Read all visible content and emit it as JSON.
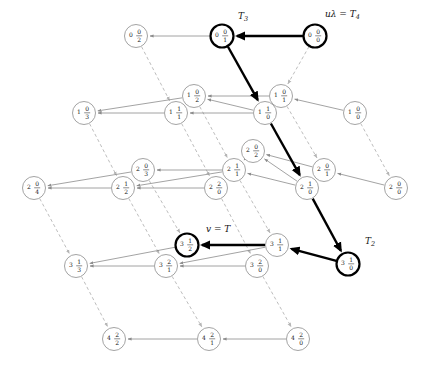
{
  "figure": {
    "type": "state-transition-diagram",
    "node_radius": 11.5,
    "colors": {
      "node_stroke": "#8c8c8c",
      "node_stroke_bold": "#000000",
      "edge_solid": "#8c8c8c",
      "edge_dashed": "#b5b5b5",
      "edge_bold": "#000000",
      "text": "#1a1a1a",
      "background": "#ffffff"
    }
  },
  "nodes": [
    {
      "id": "n002",
      "top": "0 0",
      "bottom": "2",
      "x": 136,
      "y": 36,
      "bold": false,
      "label": ""
    },
    {
      "id": "n001",
      "top": "0 0",
      "bottom": "1",
      "x": 222,
      "y": 36,
      "bold": true,
      "label": "T3"
    },
    {
      "id": "n000",
      "top": "0 0",
      "bottom": "0",
      "x": 315,
      "y": 36,
      "bold": true,
      "label": "u4"
    },
    {
      "id": "n103",
      "top": "1 0",
      "bottom": "3",
      "x": 84,
      "y": 113,
      "bold": false,
      "label": ""
    },
    {
      "id": "n111",
      "top": "1 1",
      "bottom": "1",
      "x": 176,
      "y": 113,
      "bold": false,
      "label": ""
    },
    {
      "id": "n102",
      "top": "1 0",
      "bottom": "2",
      "x": 194,
      "y": 96,
      "bold": false,
      "label": ""
    },
    {
      "id": "n110",
      "top": "1 1",
      "bottom": "0",
      "x": 265,
      "y": 113,
      "bold": false,
      "label": ""
    },
    {
      "id": "n101",
      "top": "1 0",
      "bottom": "1",
      "x": 281,
      "y": 96,
      "bold": false,
      "label": ""
    },
    {
      "id": "n100",
      "top": "1 0",
      "bottom": "0",
      "x": 355,
      "y": 113,
      "bold": false,
      "label": ""
    },
    {
      "id": "n204",
      "top": "2 0",
      "bottom": "4",
      "x": 34,
      "y": 188,
      "bold": false,
      "label": ""
    },
    {
      "id": "n212",
      "top": "2 1",
      "bottom": "2",
      "x": 123,
      "y": 188,
      "bold": false,
      "label": ""
    },
    {
      "id": "n203",
      "top": "2 0",
      "bottom": "3",
      "x": 143,
      "y": 170,
      "bold": false,
      "label": ""
    },
    {
      "id": "n220",
      "top": "2 2",
      "bottom": "0",
      "x": 216,
      "y": 188,
      "bold": false,
      "label": ""
    },
    {
      "id": "n211",
      "top": "2 1",
      "bottom": "1",
      "x": 234,
      "y": 170,
      "bold": false,
      "label": ""
    },
    {
      "id": "n202",
      "top": "2 0",
      "bottom": "2",
      "x": 253,
      "y": 151,
      "bold": false,
      "label": ""
    },
    {
      "id": "n210",
      "top": "2 1",
      "bottom": "0",
      "x": 307,
      "y": 188,
      "bold": false,
      "label": ""
    },
    {
      "id": "n201",
      "top": "2 0",
      "bottom": "1",
      "x": 324,
      "y": 170,
      "bold": false,
      "label": ""
    },
    {
      "id": "n200",
      "top": "2 0",
      "bottom": "0",
      "x": 396,
      "y": 188,
      "bold": false,
      "label": ""
    },
    {
      "id": "n313",
      "top": "3 1",
      "bottom": "3",
      "x": 76,
      "y": 266,
      "bold": false,
      "label": ""
    },
    {
      "id": "n321",
      "top": "3 2",
      "bottom": "1",
      "x": 166,
      "y": 266,
      "bold": false,
      "label": ""
    },
    {
      "id": "n312",
      "top": "3 1",
      "bottom": "2",
      "x": 187,
      "y": 245,
      "bold": true,
      "label": "v"
    },
    {
      "id": "n320",
      "top": "3 2",
      "bottom": "0",
      "x": 257,
      "y": 266,
      "bold": false,
      "label": ""
    },
    {
      "id": "n311",
      "top": "3 1",
      "bottom": "1",
      "x": 277,
      "y": 245,
      "bold": false,
      "label": ""
    },
    {
      "id": "n310",
      "top": "3 1",
      "bottom": "0",
      "x": 348,
      "y": 264,
      "bold": true,
      "label": "T2"
    },
    {
      "id": "n422",
      "top": "4 2",
      "bottom": "2",
      "x": 114,
      "y": 339,
      "bold": false,
      "label": ""
    },
    {
      "id": "n421",
      "top": "4 2",
      "bottom": "1",
      "x": 209,
      "y": 339,
      "bold": false,
      "label": ""
    },
    {
      "id": "n420",
      "top": "4 2",
      "bottom": "0",
      "x": 298,
      "y": 339,
      "bold": false,
      "label": ""
    }
  ],
  "external_labels": [
    {
      "id": "lbl-t3",
      "text": "T",
      "sub": "3",
      "prefix": "",
      "x": 238,
      "y": 16
    },
    {
      "id": "lbl-u4",
      "text": "T",
      "sub": "4",
      "prefix": "uλ =",
      "x": 325,
      "y": 14
    },
    {
      "id": "lbl-v",
      "text": "T",
      "sub": "",
      "prefix": "v =",
      "x": 206,
      "y": 229
    },
    {
      "id": "lbl-t2",
      "text": "T",
      "sub": "2",
      "prefix": "",
      "x": 365,
      "y": 241
    }
  ],
  "edges_bold": [
    {
      "from": "n000",
      "to": "n001"
    },
    {
      "from": "n001",
      "to": "n110"
    },
    {
      "from": "n110",
      "to": "n210"
    },
    {
      "from": "n210",
      "to": "n310"
    },
    {
      "from": "n310",
      "to": "n311"
    },
    {
      "from": "n311",
      "to": "n312"
    }
  ],
  "edges_solid": [
    {
      "from": "n001",
      "to": "n002"
    },
    {
      "from": "n110",
      "to": "n102"
    },
    {
      "from": "n110",
      "to": "n111"
    },
    {
      "from": "n101",
      "to": "n102"
    },
    {
      "from": "n100",
      "to": "n101"
    },
    {
      "from": "n111",
      "to": "n103"
    },
    {
      "from": "n102",
      "to": "n103"
    },
    {
      "from": "n211",
      "to": "n203"
    },
    {
      "from": "n202",
      "to": "n211"
    },
    {
      "from": "n210",
      "to": "n202"
    },
    {
      "from": "n210",
      "to": "n211"
    },
    {
      "from": "n201",
      "to": "n202"
    },
    {
      "from": "n200",
      "to": "n201"
    },
    {
      "from": "n220",
      "to": "n212"
    },
    {
      "from": "n211",
      "to": "n212"
    },
    {
      "from": "n203",
      "to": "n204"
    },
    {
      "from": "n212",
      "to": "n204"
    },
    {
      "from": "n311",
      "to": "n321"
    },
    {
      "from": "n320",
      "to": "n321"
    },
    {
      "from": "n321",
      "to": "n313"
    },
    {
      "from": "n312",
      "to": "n313"
    },
    {
      "from": "n421",
      "to": "n422"
    },
    {
      "from": "n420",
      "to": "n421"
    }
  ],
  "edges_dashed": [
    {
      "from": "n002",
      "to": "n111"
    },
    {
      "from": "n000",
      "to": "n101"
    },
    {
      "from": "n103",
      "to": "n212"
    },
    {
      "from": "n111",
      "to": "n220"
    },
    {
      "from": "n102",
      "to": "n211"
    },
    {
      "from": "n101",
      "to": "n201"
    },
    {
      "from": "n100",
      "to": "n200"
    },
    {
      "from": "n204",
      "to": "n313"
    },
    {
      "from": "n212",
      "to": "n321"
    },
    {
      "from": "n203",
      "to": "n312"
    },
    {
      "from": "n220",
      "to": "n320"
    },
    {
      "from": "n211",
      "to": "n311"
    },
    {
      "from": "n313",
      "to": "n422"
    },
    {
      "from": "n321",
      "to": "n421"
    },
    {
      "from": "n320",
      "to": "n420"
    }
  ]
}
